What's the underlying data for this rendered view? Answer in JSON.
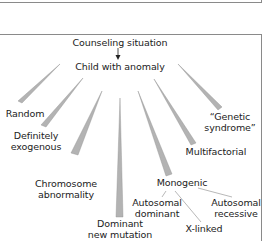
{
  "diagram": {
    "root": "Counseling situation",
    "center": "Child with anomaly",
    "branches": [
      {
        "id": "random",
        "line1": "Random",
        "line2": ""
      },
      {
        "id": "exogenous",
        "line1": "Definitely",
        "line2": "exogenous"
      },
      {
        "id": "chromosome",
        "line1": "Chromosome",
        "line2": "abnormality"
      },
      {
        "id": "dominant-new",
        "line1": "Dominant",
        "line2": "new mutation"
      },
      {
        "id": "monogenic",
        "line1": "Monogenic",
        "line2": ""
      },
      {
        "id": "multifactorial",
        "line1": "Multifactorial",
        "line2": ""
      },
      {
        "id": "genetic-syndrome",
        "line1": "“Genetic",
        "line2": "syndrome”"
      }
    ],
    "monogenic_children": [
      {
        "id": "ad",
        "line1": "Autosomal",
        "line2": "dominant"
      },
      {
        "id": "xl",
        "line1": "X-linked",
        "line2": ""
      },
      {
        "id": "ar",
        "line1": "Autosomal",
        "line2": "recessive"
      }
    ],
    "colors": {
      "wedge_fill": "#b3b3b3",
      "wedge_edge": "#8f8f8f",
      "line": "#9a9a9a",
      "frame": "#8a8a8a"
    }
  }
}
